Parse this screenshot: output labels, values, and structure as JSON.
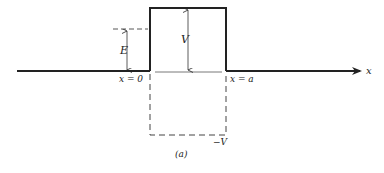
{
  "figure": {
    "caption": "(a)",
    "labels": {
      "energy": "E",
      "barrier_height": "V",
      "well_depth": "−V",
      "left_edge": "x = 0",
      "right_edge": "x = a",
      "axis": "x"
    },
    "colors": {
      "line": "#222222",
      "dashed": "#444444",
      "background": "#ffffff"
    }
  }
}
